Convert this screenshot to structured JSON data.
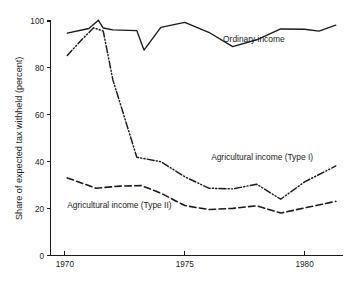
{
  "chart_data": {
    "type": "line",
    "title": "",
    "subtitle": "",
    "xlabel": "",
    "ylabel": "Share of expected tax withheld  (percent)",
    "xlim": [
      1969.4,
      1981.6
    ],
    "ylim": [
      0,
      100
    ],
    "grid": false,
    "legend_position": "inline-annotations",
    "y_ticks": [
      "0",
      "20",
      "40",
      "60",
      "80",
      "100"
    ],
    "y_tick_values": [
      0,
      20,
      40,
      60,
      80,
      100
    ],
    "x_ticks": [
      "1970",
      "1975",
      "1980"
    ],
    "x_tick_values": [
      1970,
      1975,
      1980
    ],
    "annotations": [
      {
        "name": "ordinary-income-label",
        "text": "Ordinary income",
        "x": 1976.6,
        "y": 91.0
      },
      {
        "name": "type1-label",
        "text": "Agricultural income (Type I)",
        "x": 1976.1,
        "y": 40.6
      },
      {
        "name": "type2-label",
        "text": "Agricultural income (Type II)",
        "x": 1970.1,
        "y": 20.2
      }
    ],
    "series": [
      {
        "name": "Ordinary income",
        "style": "solid",
        "x": [
          1970.1,
          1971.0,
          1971.4,
          1971.6,
          1972.0,
          1973.0,
          1973.3,
          1974.0,
          1975.0,
          1976.0,
          1977.0,
          1978.0,
          1979.0,
          1980.0,
          1980.6,
          1981.3
        ],
        "values": [
          94.8,
          96.8,
          100.3,
          97.0,
          96.2,
          95.9,
          87.6,
          97.3,
          99.4,
          95.2,
          89.1,
          92.0,
          96.6,
          96.5,
          95.7,
          98.2
        ]
      },
      {
        "name": "Agricultural income (Type I)",
        "style": "dash-dot",
        "x": [
          1970.1,
          1970.7,
          1971.2,
          1971.6,
          1972.0,
          1973.0,
          1974.0,
          1975.0,
          1976.0,
          1977.0,
          1978.0,
          1979.0,
          1980.0,
          1981.3
        ],
        "values": [
          85.3,
          92.0,
          97.1,
          95.7,
          75.0,
          41.9,
          40.0,
          33.6,
          28.7,
          28.4,
          30.4,
          24.0,
          31.4,
          38.2
        ]
      },
      {
        "name": "Agricultural income (Type II)",
        "style": "dashed",
        "x": [
          1970.1,
          1971.3,
          1972.3,
          1973.2,
          1974.0,
          1975.0,
          1976.0,
          1977.0,
          1978.0,
          1979.0,
          1980.0,
          1981.3
        ],
        "values": [
          33.1,
          28.7,
          29.6,
          29.8,
          26.6,
          21.3,
          19.6,
          20.1,
          21.2,
          18.1,
          20.3,
          23.1
        ]
      }
    ]
  }
}
